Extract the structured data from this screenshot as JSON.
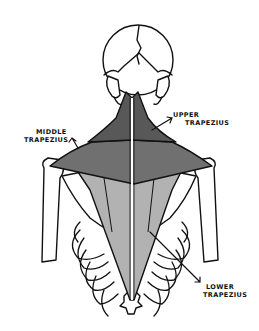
{
  "diagram": {
    "labels": {
      "upper": [
        "UPPER",
        "TRAPEZIUS"
      ],
      "middle": [
        "MIDDLE",
        "TRAPEZIUS"
      ],
      "lower": [
        "LOWER",
        "TRAPEZIUS"
      ]
    },
    "colors": {
      "upper": "#585858",
      "middle": "#707070",
      "lower": "#b2b2b2",
      "outline": "#111111",
      "bone": "#ffffff",
      "background": "#ffffff"
    }
  }
}
